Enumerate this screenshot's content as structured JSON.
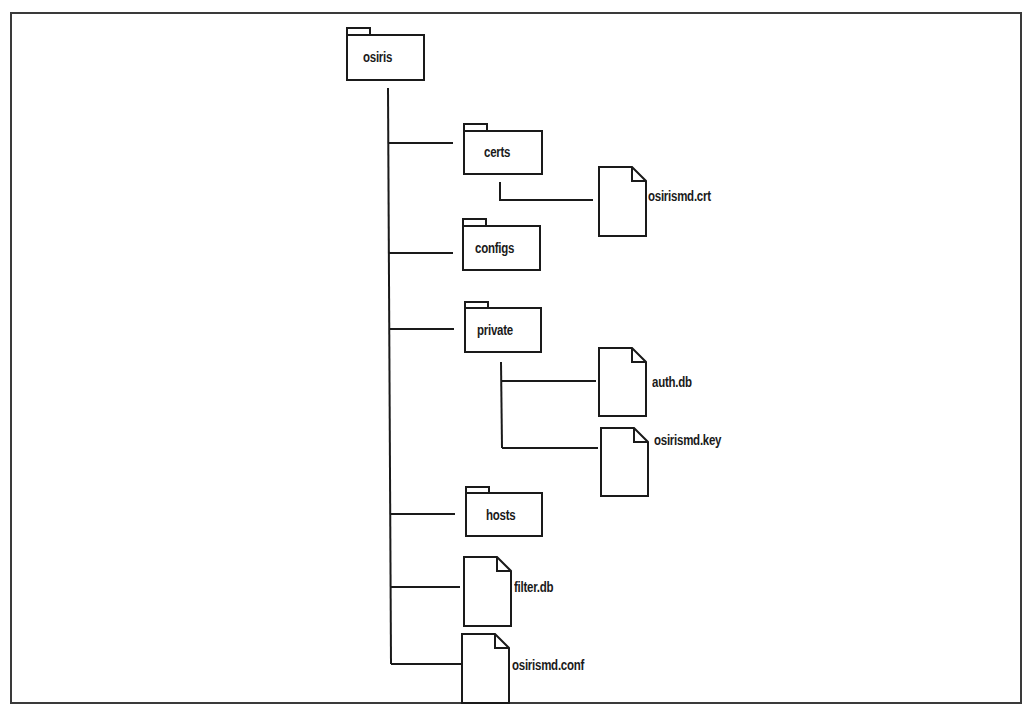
{
  "diagram": {
    "type": "directory-tree",
    "title_partially_visible": true,
    "root": {
      "name": "osiris",
      "kind": "folder",
      "children": [
        {
          "name": "certs",
          "kind": "folder",
          "children": [
            {
              "name": "osirismd.crt",
              "kind": "file"
            }
          ]
        },
        {
          "name": "configs",
          "kind": "folder",
          "children": []
        },
        {
          "name": "private",
          "kind": "folder",
          "children": [
            {
              "name": "auth.db",
              "kind": "file"
            },
            {
              "name": "osirismd.key",
              "kind": "file"
            }
          ]
        },
        {
          "name": "hosts",
          "kind": "folder",
          "children": []
        },
        {
          "name": "filter.db",
          "kind": "file"
        },
        {
          "name": "osirismd.conf",
          "kind": "file"
        }
      ]
    }
  },
  "labels": {
    "root": "osiris",
    "certs": "certs",
    "crt": "osirismd.crt",
    "configs": "configs",
    "private": "private",
    "authdb": "auth.db",
    "key": "osirismd.key",
    "hosts": "hosts",
    "filterdb": "filter.db",
    "conf": "osirismd.conf"
  },
  "colors": {
    "line": "#1a1a1a",
    "background": "#ffffff"
  }
}
